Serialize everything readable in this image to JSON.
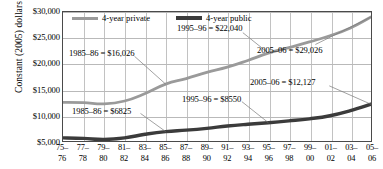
{
  "chart_data": {
    "type": "line",
    "title": "",
    "xlabel": "",
    "ylabel": "Constant (2005) dollars",
    "ylim": [
      5000,
      30000
    ],
    "ytick_values": [
      5000,
      10000,
      15000,
      20000,
      25000,
      30000
    ],
    "ytick_labels": [
      "$5,000",
      "$10,000",
      "$15,000",
      "$20,000",
      "$25,000",
      "$30,000"
    ],
    "grid": true,
    "legend_position": "top-left inside plot",
    "categories": [
      "75-76",
      "77-78",
      "79-80",
      "81-82",
      "83-84",
      "85-86",
      "87-88",
      "89-90",
      "91-92",
      "93-94",
      "95-96",
      "97-98",
      "99-00",
      "01-02",
      "03-04",
      "05-06"
    ],
    "xtick_labels": [
      {
        "top": "75–",
        "bottom": "76"
      },
      {
        "top": "77–",
        "bottom": "78"
      },
      {
        "top": "79–",
        "bottom": "80"
      },
      {
        "top": "81–",
        "bottom": "82"
      },
      {
        "top": "83–",
        "bottom": "84"
      },
      {
        "top": "85–",
        "bottom": "86"
      },
      {
        "top": "87–",
        "bottom": "88"
      },
      {
        "top": "89–",
        "bottom": "90"
      },
      {
        "top": "91–",
        "bottom": "92"
      },
      {
        "top": "93–",
        "bottom": "94"
      },
      {
        "top": "95–",
        "bottom": "96"
      },
      {
        "top": "97–",
        "bottom": "98"
      },
      {
        "top": "99–",
        "bottom": "00"
      },
      {
        "top": "01–",
        "bottom": "02"
      },
      {
        "top": "03–",
        "bottom": "04"
      },
      {
        "top": "05–",
        "bottom": "06"
      }
    ],
    "series": [
      {
        "name": "4-year private",
        "color": "#9a9a9a",
        "values": [
          12500,
          12450,
          12200,
          12750,
          14200,
          16026,
          17100,
          18300,
          19300,
          20600,
          22040,
          23100,
          24200,
          25400,
          26900,
          29026
        ]
      },
      {
        "name": "4-year public",
        "color": "#3b3b3b",
        "values": [
          5600,
          5500,
          5300,
          5600,
          6300,
          6825,
          7100,
          7450,
          7900,
          8250,
          8550,
          8900,
          9300,
          9900,
          10900,
          12127
        ]
      }
    ],
    "annotations": [
      {
        "id": "private-1985",
        "text": "1985–86 = $16,026"
      },
      {
        "id": "private-1995",
        "text": "1995–96 = $22,040"
      },
      {
        "id": "private-2005",
        "text": "2005–06 = $29,026"
      },
      {
        "id": "public-1985",
        "text": "1985–86 = $6825"
      },
      {
        "id": "public-1995",
        "text": "1995–96 = $8550"
      },
      {
        "id": "public-2005",
        "text": "2005–06 = $12,127"
      }
    ]
  }
}
